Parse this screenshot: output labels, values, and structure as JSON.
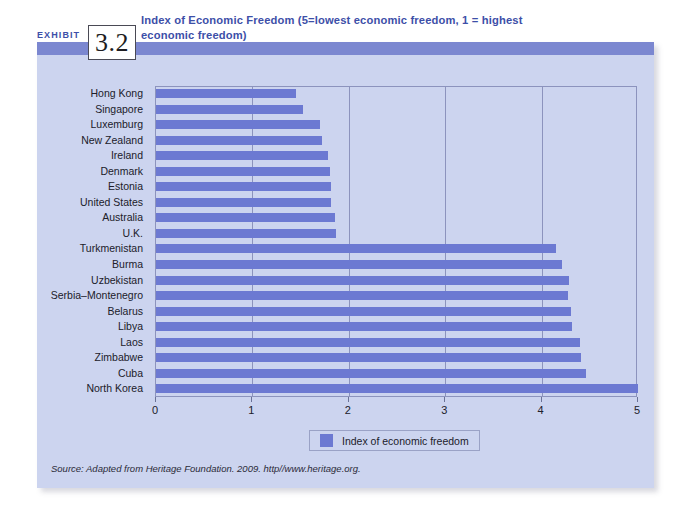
{
  "exhibit": {
    "label": "EXHIBIT",
    "number": "3.2"
  },
  "chart_data": {
    "type": "bar",
    "orientation": "horizontal",
    "title": "Index of Economic Freedom (5=lowest economic freedom, 1 = highest economic freedom)",
    "xlabel": "",
    "ylabel": "",
    "xlim": [
      0,
      5
    ],
    "xticks": [
      "0",
      "1",
      "2",
      "3",
      "4",
      "5"
    ],
    "grid": true,
    "legend_position": "bottom-center",
    "legend": [
      "Index of economic freedom"
    ],
    "series": [
      {
        "name": "Index of economic freedom",
        "color": "#6c79d2",
        "values": [
          1.45,
          1.52,
          1.7,
          1.72,
          1.78,
          1.81,
          1.82,
          1.82,
          1.86,
          1.87,
          4.15,
          4.21,
          4.28,
          4.27,
          4.31,
          4.32,
          4.4,
          4.41,
          4.46,
          5.0
        ]
      }
    ],
    "categories": [
      "Hong Kong",
      "Singapore",
      "Luxemburg",
      "New Zealand",
      "Ireland",
      "Denmark",
      "Estonia",
      "United States",
      "Australia",
      "U.K.",
      "Turkmenistan",
      "Burma",
      "Uzbekistan",
      "Serbia–Montenegro",
      "Belarus",
      "Libya",
      "Laos",
      "Zimbabwe",
      "Cuba",
      "North Korea"
    ],
    "source": "Source: Adapted from Heritage Foundation. 2009. http//www.heritage.org."
  },
  "colors": {
    "panel_background": "#ccd4ef",
    "header_bar": "#7b87d0",
    "bar": "#6c79d2",
    "title_text": "#3d4fa8",
    "gridline": "#8c93bd"
  }
}
